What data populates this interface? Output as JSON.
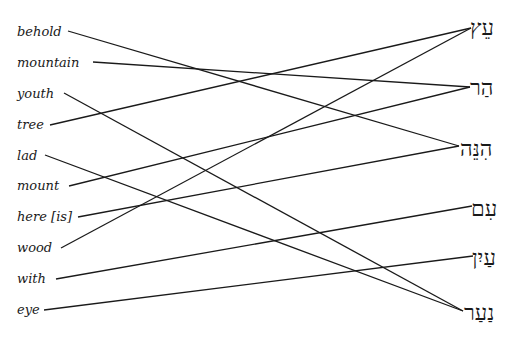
{
  "english_words": [
    {
      "label": "behold",
      "x": 17,
      "y": 24,
      "line_x": 68,
      "line_y": 31
    },
    {
      "label": "mountain",
      "x": 17,
      "y": 55,
      "line_x": 93,
      "line_y": 62
    },
    {
      "label": "youth",
      "x": 17,
      "y": 86,
      "line_x": 64,
      "line_y": 93
    },
    {
      "label": "tree",
      "x": 17,
      "y": 117,
      "line_x": 50,
      "line_y": 125
    },
    {
      "label": "lad",
      "x": 17,
      "y": 148,
      "line_x": 45,
      "line_y": 155
    },
    {
      "label": "mount",
      "x": 17,
      "y": 178,
      "line_x": 69,
      "line_y": 186
    },
    {
      "label": "here [is]",
      "x": 17,
      "y": 209,
      "line_x": 78,
      "line_y": 217
    },
    {
      "label": "wood",
      "x": 17,
      "y": 240,
      "line_x": 61,
      "line_y": 248
    },
    {
      "label": "with",
      "x": 17,
      "y": 271,
      "line_x": 56,
      "line_y": 279
    },
    {
      "label": "eye",
      "x": 17,
      "y": 302,
      "line_x": 44,
      "line_y": 310
    }
  ],
  "hebrew_words": [
    {
      "label": "עֵץ",
      "gloss_id": "ets",
      "x": 470,
      "y": 15,
      "line_x": 471,
      "line_y": 28
    },
    {
      "label": "הַר",
      "gloss_id": "har",
      "x": 470,
      "y": 75,
      "line_x": 470,
      "line_y": 87
    },
    {
      "label": "הִנֵּה",
      "gloss_id": "hinneh",
      "x": 460,
      "y": 136,
      "line_x": 459,
      "line_y": 146
    },
    {
      "label": "עִם",
      "gloss_id": "im",
      "x": 471,
      "y": 196,
      "line_x": 472,
      "line_y": 206
    },
    {
      "label": "עַיִן",
      "gloss_id": "ayin",
      "x": 472,
      "y": 245,
      "line_x": 473,
      "line_y": 256
    },
    {
      "label": "נַעַר",
      "gloss_id": "naar",
      "x": 464,
      "y": 300,
      "line_x": 463,
      "line_y": 311
    }
  ],
  "connections": [
    {
      "from": "behold",
      "to": "הִנֵּה",
      "x1": 68,
      "y1": 31,
      "x2": 459,
      "y2": 146
    },
    {
      "from": "mountain",
      "to": "הַר",
      "x1": 93,
      "y1": 62,
      "x2": 470,
      "y2": 87
    },
    {
      "from": "youth",
      "to": "נַעַר",
      "x1": 64,
      "y1": 93,
      "x2": 463,
      "y2": 311
    },
    {
      "from": "tree",
      "to": "עֵץ",
      "x1": 50,
      "y1": 125,
      "x2": 471,
      "y2": 28
    },
    {
      "from": "lad",
      "to": "נַעַר",
      "x1": 45,
      "y1": 155,
      "x2": 463,
      "y2": 311
    },
    {
      "from": "mount",
      "to": "הַר",
      "x1": 69,
      "y1": 186,
      "x2": 470,
      "y2": 87
    },
    {
      "from": "here [is]",
      "to": "הִנֵּה",
      "x1": 78,
      "y1": 217,
      "x2": 459,
      "y2": 146
    },
    {
      "from": "wood",
      "to": "עֵץ",
      "x1": 61,
      "y1": 248,
      "x2": 471,
      "y2": 28
    },
    {
      "from": "with",
      "to": "עִם",
      "x1": 56,
      "y1": 279,
      "x2": 472,
      "y2": 206
    },
    {
      "from": "eye",
      "to": "עַיִן",
      "x1": 44,
      "y1": 310,
      "x2": 473,
      "y2": 256
    }
  ],
  "colors": {
    "line": "#1a1a1a",
    "text": "#1a1a1a",
    "background": "#ffffff"
  }
}
